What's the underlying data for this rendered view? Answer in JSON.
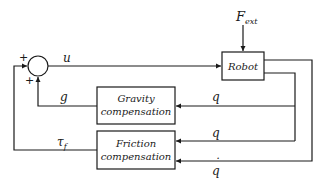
{
  "diagram": {
    "type": "block-diagram",
    "title": "",
    "colors": {
      "stroke": "#1a1a1a",
      "background": "#ffffff"
    },
    "blocks": {
      "robot": {
        "label": "Robot"
      },
      "gravity": {
        "line1": "Gravity",
        "line2": "compensation"
      },
      "friction": {
        "line1": "Friction",
        "line2": "compensation"
      }
    },
    "summing_junction": {
      "sign_top": "+",
      "sign_bottom": "+"
    },
    "signals": {
      "u": "u",
      "f_ext": "F",
      "f_ext_sub": "ext",
      "g": "g",
      "q_gravity": "q",
      "q_friction": "q",
      "qdot": "q",
      "qdot_accent": "˙",
      "tau": "τ",
      "tau_sub": "f"
    }
  }
}
